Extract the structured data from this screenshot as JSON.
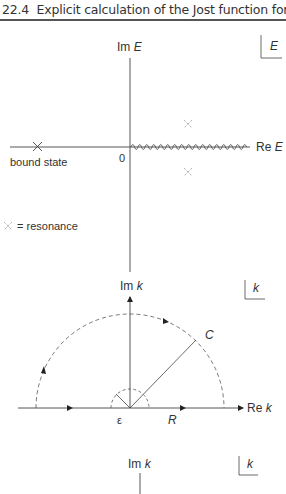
{
  "header": {
    "section": "22.4",
    "title": "Explicit calculation of the Jost function for",
    "ell": "l",
    "eq": "= 0"
  },
  "figure1": {
    "plane_label": "E",
    "im_axis_label_prefix": "Im ",
    "im_axis_label_var": "E",
    "re_axis_label_prefix": "Re ",
    "re_axis_label_var": "E",
    "origin_label": "0",
    "bound_state_label": "bound state",
    "legend_label": "= resonance"
  },
  "figure2": {
    "plane_label": "k",
    "im_axis_label_prefix": "Im ",
    "im_axis_label_var": "k",
    "re_axis_label_prefix": "Re ",
    "re_axis_label_var": "k",
    "contour_label": "C",
    "radius_label": "R",
    "epsilon_label": "ε"
  },
  "figure3": {
    "plane_label": "k",
    "im_axis_label_prefix": "Im ",
    "im_axis_label_var": "k"
  }
}
